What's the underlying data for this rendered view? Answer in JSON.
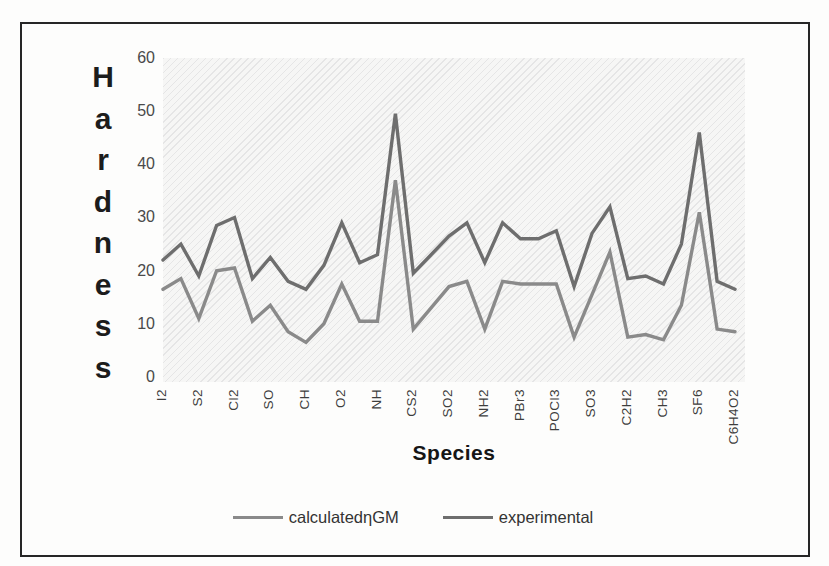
{
  "chart_data": {
    "type": "line",
    "title": "",
    "xlabel": "Species",
    "ylabel": "Hardness",
    "ylim": [
      0,
      60
    ],
    "y_ticks": [
      0,
      10,
      20,
      30,
      40,
      50,
      60
    ],
    "x_tick_labels": [
      "I2",
      "S2",
      "Cl2",
      "SO",
      "CH",
      "O2",
      "NH",
      "CS2",
      "SO2",
      "NH2",
      "PBr3",
      "POCl3",
      "SO3",
      "C2H2",
      "CH3",
      "SF6",
      "C6H4O2"
    ],
    "label_interval": 2,
    "n_points": 33,
    "note": "labels are shown for every 2nd data point; unlabeled intermediate points exist between listed species",
    "grid": false,
    "legend_position": "bottom",
    "plot_background": "light diagonal hatch",
    "series": [
      {
        "name": "calculatedηGM",
        "color": "#8a8a8a",
        "values": [
          16.5,
          18.5,
          11,
          20,
          20.5,
          10.5,
          13.5,
          8.5,
          6.5,
          10,
          17.5,
          10.5,
          10.5,
          37,
          9,
          13,
          17,
          18,
          9,
          18,
          17.5,
          17.5,
          17.5,
          7.5,
          15.5,
          23.5,
          7.5,
          8,
          7,
          13.5,
          31,
          9,
          8.5
        ]
      },
      {
        "name": "experimental",
        "color": "#6e6e6e",
        "values": [
          22,
          25,
          19,
          28.5,
          30,
          18.5,
          22.5,
          18,
          16.5,
          21,
          29,
          21.5,
          23,
          49.5,
          19.5,
          23,
          26.5,
          29,
          21.5,
          29,
          26,
          26,
          27.5,
          17,
          27,
          32,
          18.5,
          19,
          17.5,
          25,
          46,
          18,
          16.5
        ]
      }
    ]
  }
}
